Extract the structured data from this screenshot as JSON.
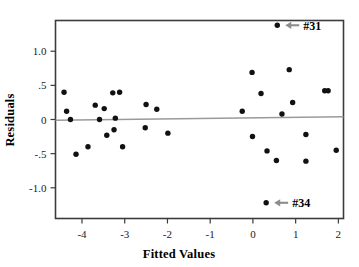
{
  "chart_data": {
    "type": "scatter",
    "title": "",
    "xlabel": "Fitted Values",
    "ylabel": "Residuals",
    "xlim": [
      -4.62,
      2.12
    ],
    "ylim": [
      -1.45,
      1.45
    ],
    "grid": false,
    "legend": null,
    "xticks": [
      -4,
      -3,
      -2,
      -1,
      0,
      1,
      2
    ],
    "xticklabels": [
      "-4",
      "-3",
      "-2",
      "-1",
      "0",
      "1",
      "2"
    ],
    "yticks": [
      1.0,
      0.5,
      0.0,
      -0.5,
      -1.0
    ],
    "yticklabels": [
      "1.0",
      ".5",
      "0",
      "-.5",
      "-1.0"
    ],
    "reference_line": {
      "type": "horizontal-fit",
      "y_at_xmin": -0.01,
      "y_at_xmax": 0.04,
      "color": "#9a9a9a"
    },
    "point_color": "#111111",
    "points": [
      {
        "x": -4.42,
        "y": 0.4
      },
      {
        "x": -4.36,
        "y": 0.12
      },
      {
        "x": -4.27,
        "y": 0.0
      },
      {
        "x": -4.14,
        "y": -0.51
      },
      {
        "x": -3.86,
        "y": -0.4
      },
      {
        "x": -3.69,
        "y": 0.21
      },
      {
        "x": -3.59,
        "y": 0.0
      },
      {
        "x": -3.48,
        "y": 0.16
      },
      {
        "x": -3.42,
        "y": -0.23
      },
      {
        "x": -3.28,
        "y": 0.39
      },
      {
        "x": -3.25,
        "y": -0.15
      },
      {
        "x": -3.22,
        "y": 0.02
      },
      {
        "x": -3.12,
        "y": 0.4
      },
      {
        "x": -3.05,
        "y": -0.4
      },
      {
        "x": -2.52,
        "y": -0.12
      },
      {
        "x": -2.5,
        "y": 0.22
      },
      {
        "x": -2.25,
        "y": 0.15
      },
      {
        "x": -1.99,
        "y": -0.2
      },
      {
        "x": -0.25,
        "y": 0.12
      },
      {
        "x": -0.02,
        "y": 0.69
      },
      {
        "x": -0.01,
        "y": -0.25
      },
      {
        "x": 0.19,
        "y": 0.38
      },
      {
        "x": 0.33,
        "y": -0.46
      },
      {
        "x": 0.55,
        "y": -0.6
      },
      {
        "x": 0.68,
        "y": 0.08
      },
      {
        "x": 0.85,
        "y": 0.73
      },
      {
        "x": 0.93,
        "y": 0.25
      },
      {
        "x": 1.24,
        "y": -0.22
      },
      {
        "x": 1.24,
        "y": -0.61
      },
      {
        "x": 1.68,
        "y": 0.42
      },
      {
        "x": 1.76,
        "y": 0.42
      },
      {
        "x": 1.95,
        "y": -0.45
      },
      {
        "x": 0.57,
        "y": 1.38,
        "label": "#31"
      },
      {
        "x": 0.31,
        "y": -1.22,
        "label": "#34"
      }
    ],
    "annotations": [
      {
        "label": "#31",
        "x": 0.57,
        "y": 1.38,
        "arrow": "left"
      },
      {
        "label": "#34",
        "x": 0.31,
        "y": -1.22,
        "arrow": "left"
      }
    ]
  }
}
